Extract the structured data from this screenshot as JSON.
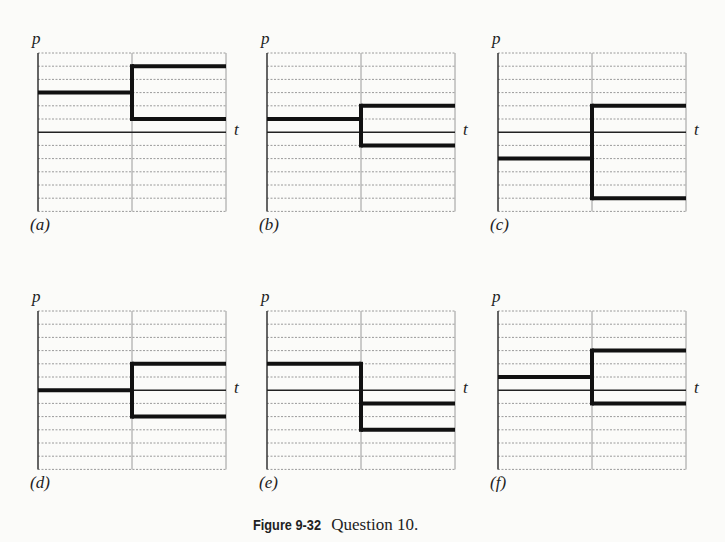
{
  "figure": {
    "caption_label": "Figure 9-32",
    "caption_text": "Question 10."
  },
  "chart_data": [
    {
      "type": "line",
      "panel": "(a)",
      "ylabel": "p",
      "xlabel": "t",
      "grid_units": {
        "above_axis": 6,
        "below_axis": 6
      },
      "before": [
        3
      ],
      "after": [
        5,
        1
      ]
    },
    {
      "type": "line",
      "panel": "(b)",
      "ylabel": "p",
      "xlabel": "t",
      "grid_units": {
        "above_axis": 6,
        "below_axis": 6
      },
      "before": [
        1
      ],
      "after": [
        2,
        -1
      ]
    },
    {
      "type": "line",
      "panel": "(c)",
      "ylabel": "p",
      "xlabel": "t",
      "grid_units": {
        "above_axis": 6,
        "below_axis": 6
      },
      "before": [
        -2
      ],
      "after": [
        2,
        -5
      ]
    },
    {
      "type": "line",
      "panel": "(d)",
      "ylabel": "p",
      "xlabel": "t",
      "grid_units": {
        "above_axis": 6,
        "below_axis": 6
      },
      "before": [
        0
      ],
      "after": [
        2,
        -2
      ]
    },
    {
      "type": "line",
      "panel": "(e)",
      "ylabel": "p",
      "xlabel": "t",
      "grid_units": {
        "above_axis": 6,
        "below_axis": 6
      },
      "before": [
        2
      ],
      "after": [
        -1,
        -3
      ]
    },
    {
      "type": "line",
      "panel": "(f)",
      "ylabel": "p",
      "xlabel": "t",
      "grid_units": {
        "above_axis": 6,
        "below_axis": 6
      },
      "before": [
        1
      ],
      "after": [
        3,
        -1
      ]
    }
  ],
  "panels": [
    {
      "label": "(a)",
      "x": 38,
      "y": 53
    },
    {
      "label": "(b)",
      "x": 267,
      "y": 53
    },
    {
      "label": "(c)",
      "x": 498,
      "y": 53
    },
    {
      "label": "(d)",
      "x": 38,
      "y": 311
    },
    {
      "label": "(e)",
      "x": 267,
      "y": 311
    },
    {
      "label": "(f)",
      "x": 498,
      "y": 311
    }
  ],
  "axis": {
    "y_label": "p",
    "x_label": "t"
  }
}
